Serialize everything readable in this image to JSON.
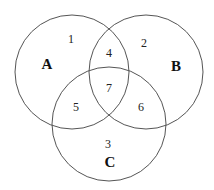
{
  "diagram": {
    "type": "venn",
    "sets": [
      {
        "label": "A",
        "cx": 72,
        "cy": 72,
        "r": 57,
        "label_x": 47,
        "label_y": 66
      },
      {
        "label": "B",
        "cx": 146,
        "cy": 72,
        "r": 57,
        "label_x": 176,
        "label_y": 68
      },
      {
        "label": "C",
        "cx": 109,
        "cy": 124,
        "r": 57,
        "label_x": 110,
        "label_y": 164
      }
    ],
    "regions": [
      {
        "label": "1",
        "x": 71,
        "y": 40
      },
      {
        "label": "2",
        "x": 144,
        "y": 44
      },
      {
        "label": "3",
        "x": 108,
        "y": 145
      },
      {
        "label": "4",
        "x": 109,
        "y": 54
      },
      {
        "label": "5",
        "x": 76,
        "y": 108
      },
      {
        "label": "6",
        "x": 141,
        "y": 108
      },
      {
        "label": "7",
        "x": 109,
        "y": 89
      }
    ],
    "stroke_color": "#555555"
  }
}
